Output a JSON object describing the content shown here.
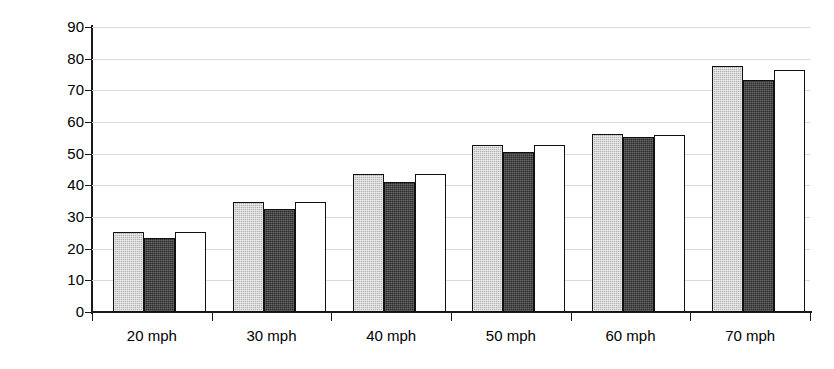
{
  "chart_data": {
    "type": "bar",
    "title": "",
    "xlabel": "",
    "ylabel": "85th percentile of vehicle speed",
    "categories": [
      "20 mph",
      "30 mph",
      "40 mph",
      "50 mph",
      "60 mph",
      "70 mph"
    ],
    "ylim": [
      0,
      90
    ],
    "ytick_labels": [
      "90",
      "80",
      "70",
      "60",
      "50",
      "40",
      "30",
      "20",
      "10",
      "0"
    ],
    "ytick_values": [
      90,
      80,
      70,
      60,
      50,
      40,
      30,
      20,
      10,
      0
    ],
    "grid": true,
    "legend": "none",
    "series": [
      {
        "name": "series-1-light-gray",
        "color": "#b4b4b4",
        "values": [
          25.2,
          34.6,
          43.6,
          52.8,
          56.3,
          77.6
        ]
      },
      {
        "name": "series-2-dark-gray",
        "color": "#2d2d2d",
        "values": [
          23.5,
          32.5,
          41.2,
          50.4,
          55.4,
          73.3
        ]
      },
      {
        "name": "series-3-white",
        "color": "#ffffff",
        "values": [
          25.4,
          34.6,
          43.6,
          52.8,
          56.0,
          76.5
        ]
      }
    ]
  },
  "axis": {
    "line_color": "#1a1a1a",
    "grid_color": "#d9d9d9"
  }
}
